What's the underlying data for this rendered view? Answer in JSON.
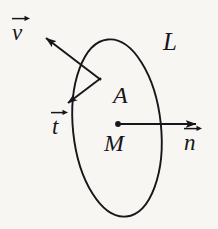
{
  "figure": {
    "background_color": "#f7f6f3",
    "ink_color": "#17161a",
    "width": 218,
    "height": 229
  },
  "shapes": {
    "contour": {
      "name": "ellipse-contour",
      "label": "L",
      "center_x": 117,
      "center_y": 128,
      "radius_x": 44,
      "radius_y": 89,
      "rotation_deg": -6
    },
    "center_point": {
      "name": "center-dot",
      "label": "M",
      "x": 118,
      "y": 124
    },
    "area": {
      "name": "area-label",
      "label": "A"
    }
  },
  "labels": {
    "contour_L": "L",
    "area_A": "A",
    "center_M": "M",
    "normal_n": "n",
    "tangent_t": "t",
    "velocity_v": "v"
  },
  "vectors": [
    {
      "name": "normal-vector",
      "symbol": "n",
      "from_x": 118,
      "from_y": 124,
      "to_x": 200,
      "to_y": 124,
      "label_x": 186,
      "label_y": 136
    },
    {
      "name": "tangent-vector",
      "symbol": "t",
      "from_x": 101,
      "from_y": 80,
      "to_x": 63,
      "to_y": 107,
      "label_x": 50,
      "label_y": 120
    },
    {
      "name": "velocity-vector",
      "symbol": "v",
      "from_x": 101,
      "from_y": 80,
      "to_x": 35,
      "to_y": 30,
      "label_x": 12,
      "label_y": 24
    }
  ]
}
